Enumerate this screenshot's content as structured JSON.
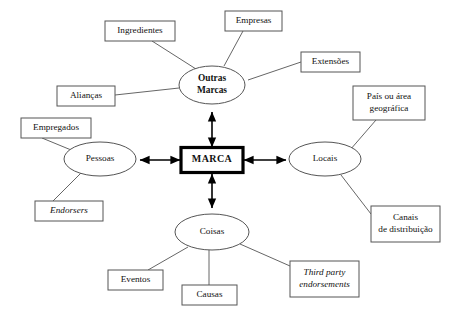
{
  "diagram": {
    "type": "concept-map",
    "core": {
      "label": "MARCA",
      "shape": "rectangle",
      "emphasis": "bold-thick-border",
      "border_color": "#000000",
      "x": 212,
      "y": 160,
      "width": 62,
      "height": 25
    },
    "hubs": [
      {
        "id": "outras-marcas",
        "label_line1": "Outras",
        "label_line2": "Marcas",
        "shape": "ellipse",
        "bold": true,
        "x": 212,
        "y": 85,
        "rx": 33,
        "ry": 19,
        "leaves": [
          "ingredientes",
          "empresas",
          "extensoes",
          "aliancas"
        ]
      },
      {
        "id": "pessoas",
        "label_line1": "Pessoas",
        "label_line2": "",
        "shape": "ellipse",
        "bold": false,
        "x": 100,
        "y": 159,
        "rx": 36,
        "ry": 17,
        "leaves": [
          "empregados",
          "endorsers"
        ]
      },
      {
        "id": "locais",
        "label_line1": "Locais",
        "label_line2": "",
        "shape": "ellipse",
        "bold": false,
        "x": 325,
        "y": 159,
        "rx": 36,
        "ry": 17,
        "leaves": [
          "pais-ou-area-geografica",
          "canais-de-distribuicao"
        ]
      },
      {
        "id": "coisas",
        "label_line1": "Coisas",
        "label_line2": "",
        "shape": "ellipse",
        "bold": false,
        "x": 212,
        "y": 232,
        "rx": 37,
        "ry": 18,
        "leaves": [
          "eventos",
          "causas",
          "third-party-endorsements"
        ]
      }
    ],
    "leaves": [
      {
        "id": "ingredientes",
        "label_line1": "Ingredientes",
        "label_line2": "",
        "italic": false,
        "x": 105,
        "y": 21,
        "width": 70,
        "height": 20
      },
      {
        "id": "empresas",
        "label_line1": "Empresas",
        "label_line2": "",
        "italic": false,
        "x": 225,
        "y": 11,
        "width": 57,
        "height": 20
      },
      {
        "id": "extensoes",
        "label_line1": "Extensões",
        "label_line2": "",
        "italic": false,
        "x": 301,
        "y": 52,
        "width": 59,
        "height": 20
      },
      {
        "id": "aliancas",
        "label_line1": "Alianças",
        "label_line2": "",
        "italic": false,
        "x": 57,
        "y": 86,
        "width": 58,
        "height": 20
      },
      {
        "id": "empregados",
        "label_line1": "Empregados",
        "label_line2": "",
        "italic": false,
        "x": 21,
        "y": 118,
        "width": 70,
        "height": 20
      },
      {
        "id": "endorsers",
        "label_line1": "Endorsers",
        "label_line2": "",
        "italic": true,
        "x": 35,
        "y": 201,
        "width": 68,
        "height": 20
      },
      {
        "id": "pais-ou-area-geografica",
        "label_line1": "País ou área",
        "label_line2": "geográfica",
        "italic": false,
        "x": 353,
        "y": 86,
        "width": 72,
        "height": 34
      },
      {
        "id": "canais-de-distribuicao",
        "label_line1": "Canais",
        "label_line2": "de distribuição",
        "italic": false,
        "x": 371,
        "y": 206,
        "width": 69,
        "height": 36
      },
      {
        "id": "eventos",
        "label_line1": "Eventos",
        "label_line2": "",
        "italic": false,
        "x": 108,
        "y": 270,
        "width": 55,
        "height": 20
      },
      {
        "id": "causas",
        "label_line1": "Causas",
        "label_line2": "",
        "italic": false,
        "x": 182,
        "y": 285,
        "width": 55,
        "height": 20
      },
      {
        "id": "third-party-endorsements",
        "label_line1": "Third party",
        "label_line2": "endorsements",
        "italic": true,
        "x": 290,
        "y": 261,
        "width": 69,
        "height": 36
      }
    ],
    "arrows": [
      {
        "id": "marca-outras-marcas",
        "x1": 212,
        "y1": 147,
        "x2": 212,
        "y2": 112,
        "double": true
      },
      {
        "id": "marca-coisas",
        "x1": 212,
        "y1": 174,
        "x2": 212,
        "y2": 208,
        "double": true
      },
      {
        "id": "marca-pessoas",
        "x1": 180,
        "y1": 160,
        "x2": 140,
        "y2": 160,
        "double": true
      },
      {
        "id": "marca-locais",
        "x1": 244,
        "y1": 160,
        "x2": 286,
        "y2": 160,
        "double": true
      }
    ],
    "connectors": [
      {
        "id": "ingredientes-outras-marcas",
        "x1": 152,
        "y1": 41,
        "x2": 196,
        "y2": 69
      },
      {
        "id": "empresas-outras-marcas",
        "x1": 243,
        "y1": 31,
        "x2": 224,
        "y2": 66
      },
      {
        "id": "extensoes-outras-marcas",
        "x1": 301,
        "y1": 62,
        "x2": 248,
        "y2": 80
      },
      {
        "id": "aliancas-outras-marcas",
        "x1": 115,
        "y1": 95,
        "x2": 179,
        "y2": 88
      },
      {
        "id": "empregados-pessoas",
        "x1": 42,
        "y1": 138,
        "x2": 76,
        "y2": 152
      },
      {
        "id": "endorsers-pessoas",
        "x1": 53,
        "y1": 201,
        "x2": 82,
        "y2": 172
      },
      {
        "id": "pais-locais",
        "x1": 376,
        "y1": 120,
        "x2": 350,
        "y2": 150
      },
      {
        "id": "canais-locais",
        "x1": 371,
        "y1": 214,
        "x2": 341,
        "y2": 175
      },
      {
        "id": "eventos-coisas",
        "x1": 148,
        "y1": 270,
        "x2": 188,
        "y2": 247
      },
      {
        "id": "causas-coisas",
        "x1": 209,
        "y1": 285,
        "x2": 209,
        "y2": 250
      },
      {
        "id": "third-party-coisas",
        "x1": 290,
        "y1": 266,
        "x2": 240,
        "y2": 244
      }
    ]
  }
}
